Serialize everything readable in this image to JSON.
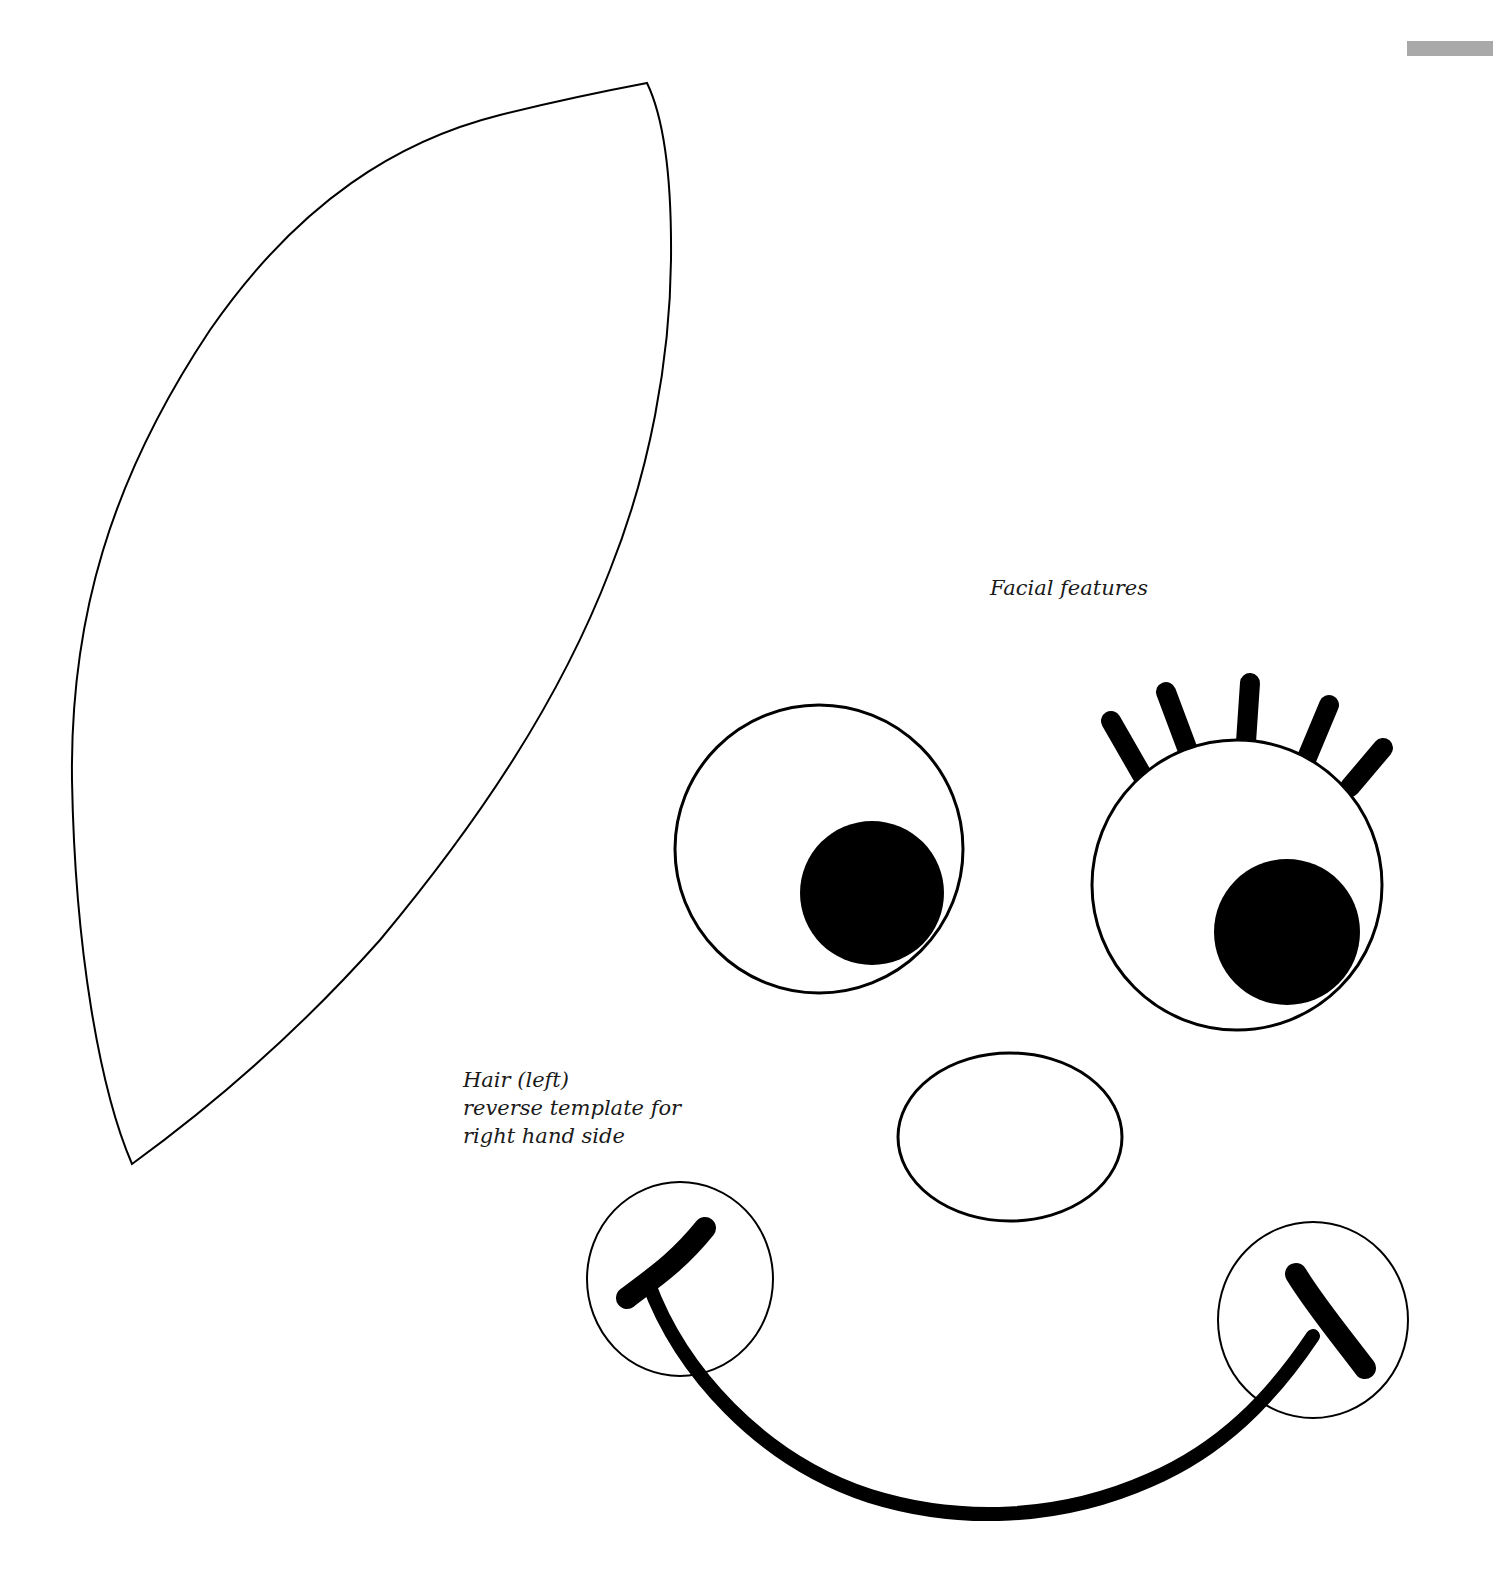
{
  "page": {
    "background": "#ffffff",
    "ink_color": "#000000",
    "tab_marker_color": "#a9a9a9"
  },
  "labels": {
    "facial_features": "Facial features",
    "hair": {
      "line1": "Hair (left)",
      "line2": "reverse template for",
      "line3": "right hand side"
    }
  },
  "shapes": {
    "hair_template": "hair-outline",
    "left_eye": "eye-with-pupil",
    "right_eye": "eye-with-lashes",
    "eyelash_count": 5,
    "nose": "oval-nose",
    "mouth": "smile-with-cheeks",
    "cheeks": 2
  }
}
